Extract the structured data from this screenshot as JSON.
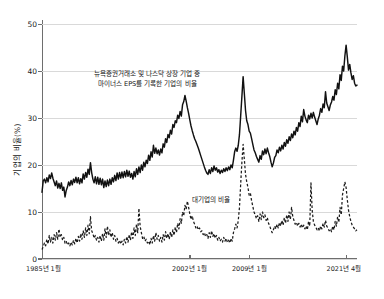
{
  "chart_data": {
    "type": "line",
    "title": "",
    "subtitle": "",
    "xlabel": "",
    "ylabel": "기업의 비율(%)",
    "ylim": [
      0,
      50
    ],
    "yticks": [
      0,
      10,
      20,
      30,
      40,
      50
    ],
    "ytick_labels": [
      "0",
      "10",
      "20",
      "30",
      "40",
      "50"
    ],
    "grid": true,
    "legend_position": "inline-annotation",
    "xtick_labels": [
      "1985년 1월",
      "2002년 1월",
      "2009년 1월",
      "2021년 4월"
    ],
    "xtick_positions": [
      0,
      0.468,
      0.658,
      0.965
    ],
    "annotations": [
      {
        "name": "series-solid-annotation",
        "line1": "뉴욕증권거래소 및 나스닥 상장 기업 중",
        "line2": "마이너스 EPS를 기록한 기업의 비율"
      },
      {
        "name": "series-dashed-annotation",
        "line1": "대기업의 비율"
      }
    ],
    "series": [
      {
        "name": "뉴욕증권거래소 및 나스닥 상장 기업 중 마이너스 EPS를 기록한 기업의 비율",
        "style": "solid",
        "color": "#111111",
        "values": [
          14.2,
          16.6,
          17.0,
          16.2,
          17.3,
          16.4,
          17.9,
          17.1,
          18.3,
          17.2,
          16.4,
          15.6,
          16.6,
          15.1,
          16.1,
          15.0,
          16.2,
          14.6,
          15.3,
          13.2,
          14.6,
          15.3,
          16.4,
          15.6,
          16.7,
          15.8,
          17.0,
          16.3,
          17.4,
          16.2,
          17.3,
          16.0,
          17.1,
          16.2,
          18.1,
          17.0,
          18.4,
          17.4,
          19.1,
          18.0,
          20.5,
          18.4,
          17.0,
          16.2,
          17.5,
          16.0,
          17.4,
          15.9,
          17.2,
          15.8,
          17.0,
          15.2,
          16.6,
          15.4,
          16.8,
          15.6,
          17.0,
          15.9,
          17.3,
          16.4,
          17.8,
          16.7,
          18.3,
          17.0,
          18.4,
          17.2,
          18.5,
          17.3,
          18.6,
          17.5,
          18.9,
          17.6,
          18.7,
          17.4,
          18.2,
          17.0,
          18.6,
          17.5,
          19.2,
          18.0,
          19.6,
          18.4,
          20.0,
          18.9,
          20.6,
          19.6,
          21.0,
          20.3,
          22.1,
          21.0,
          22.8,
          21.7,
          24.2,
          22.5,
          23.6,
          22.4,
          23.2,
          22.1,
          23.4,
          22.6,
          24.5,
          23.8,
          25.6,
          24.8,
          26.5,
          25.8,
          27.4,
          26.6,
          28.6,
          28.0,
          29.4,
          29.0,
          30.6,
          29.9,
          31.4,
          30.4,
          32.8,
          33.5,
          34.8,
          33.6,
          32.2,
          31.0,
          29.6,
          28.3,
          27.3,
          26.4,
          25.6,
          25.0,
          24.3,
          23.6,
          22.8,
          22.0,
          21.2,
          20.4,
          19.6,
          18.9,
          18.3,
          18.0,
          19.0,
          18.2,
          19.4,
          18.6,
          19.8,
          18.9,
          19.4,
          18.5,
          19.0,
          18.2,
          18.9,
          18.4,
          19.2,
          18.6,
          19.4,
          18.8,
          19.6,
          19.0,
          20.0,
          19.4,
          21.0,
          22.8,
          23.6,
          22.9,
          24.2,
          26.5,
          30.5,
          34.6,
          38.8,
          35.2,
          31.6,
          29.4,
          28.6,
          27.2,
          26.8,
          25.6,
          24.4,
          23.2,
          22.6,
          21.8,
          21.2,
          20.6,
          22.0,
          21.2,
          23.0,
          22.2,
          23.4,
          22.4,
          23.6,
          22.6,
          21.8,
          20.6,
          19.6,
          20.4,
          21.6,
          22.0,
          23.2,
          22.6,
          23.8,
          23.0,
          24.2,
          23.4,
          24.8,
          24.0,
          25.4,
          24.6,
          26.0,
          25.2,
          26.6,
          25.8,
          27.2,
          26.4,
          28.0,
          27.2,
          29.0,
          28.2,
          30.4,
          29.2,
          31.8,
          30.4,
          29.6,
          29.0,
          30.6,
          29.8,
          31.0,
          30.0,
          31.2,
          30.2,
          29.4,
          28.6,
          29.8,
          30.6,
          32.0,
          31.2,
          33.0,
          32.2,
          35.6,
          33.2,
          32.4,
          31.6,
          32.8,
          33.4,
          34.6,
          33.8,
          36.0,
          35.0,
          37.4,
          36.2,
          39.2,
          38.0,
          41.0,
          40.0,
          43.2,
          45.5,
          43.0,
          40.2,
          41.4,
          39.6,
          38.2,
          39.0,
          37.4,
          36.8,
          37.0
        ]
      },
      {
        "name": "대기업의 비율",
        "style": "dashed",
        "color": "#1c1c1c",
        "values": [
          2.0,
          2.6,
          3.4,
          2.8,
          4.2,
          3.2,
          5.0,
          3.6,
          4.6,
          3.4,
          5.2,
          4.0,
          5.6,
          4.2,
          6.4,
          4.6,
          5.2,
          4.0,
          4.6,
          3.4,
          3.8,
          3.0,
          3.4,
          2.8,
          3.6,
          3.0,
          4.0,
          3.2,
          4.4,
          3.4,
          4.8,
          3.8,
          5.4,
          4.2,
          6.0,
          4.6,
          6.6,
          5.0,
          7.2,
          5.4,
          9.0,
          6.0,
          5.4,
          4.4,
          5.0,
          4.0,
          4.6,
          3.6,
          5.0,
          3.8,
          5.4,
          4.0,
          6.4,
          4.6,
          7.0,
          5.0,
          6.2,
          4.6,
          5.6,
          4.2,
          5.0,
          3.8,
          4.4,
          3.4,
          4.0,
          3.2,
          3.8,
          3.0,
          4.2,
          3.4,
          4.8,
          3.6,
          5.2,
          4.0,
          5.8,
          4.4,
          6.6,
          5.0,
          7.4,
          5.6,
          10.8,
          7.0,
          5.6,
          4.4,
          4.8,
          3.8,
          4.2,
          3.4,
          3.8,
          3.0,
          4.4,
          3.4,
          5.0,
          3.8,
          5.6,
          4.2,
          5.0,
          3.8,
          4.6,
          3.6,
          5.2,
          4.0,
          5.8,
          4.4,
          5.4,
          4.2,
          5.8,
          4.6,
          6.2,
          5.0,
          6.8,
          5.6,
          7.6,
          6.4,
          8.6,
          7.6,
          10.0,
          9.2,
          11.4,
          10.6,
          12.3,
          11.0,
          9.6,
          8.4,
          9.2,
          8.0,
          7.4,
          6.6,
          7.0,
          6.2,
          6.6,
          5.8,
          6.0,
          5.2,
          5.6,
          4.8,
          5.2,
          4.4,
          5.6,
          4.6,
          6.0,
          4.8,
          5.4,
          4.4,
          5.0,
          4.0,
          4.6,
          3.8,
          4.2,
          3.6,
          4.6,
          3.8,
          4.4,
          3.6,
          4.0,
          3.4,
          4.4,
          3.8,
          5.6,
          6.4,
          7.4,
          6.6,
          8.2,
          11.0,
          16.0,
          20.6,
          24.4,
          21.2,
          18.0,
          16.4,
          15.2,
          13.6,
          14.0,
          12.4,
          11.2,
          10.0,
          9.4,
          8.6,
          9.2,
          8.0,
          9.6,
          8.4,
          10.0,
          8.8,
          9.4,
          8.2,
          8.8,
          7.6,
          7.0,
          6.2,
          5.6,
          6.2,
          7.0,
          6.4,
          7.4,
          6.6,
          7.8,
          7.0,
          8.2,
          7.2,
          8.8,
          7.6,
          9.4,
          8.0,
          10.0,
          8.4,
          11.0,
          9.0,
          8.2,
          7.4,
          7.8,
          7.0,
          7.6,
          6.8,
          7.4,
          6.6,
          7.2,
          6.4,
          7.0,
          6.2,
          8.0,
          7.0,
          16.2,
          10.4,
          8.0,
          7.2,
          6.8,
          6.2,
          6.6,
          6.0,
          7.0,
          6.4,
          7.6,
          6.8,
          8.2,
          7.0,
          6.6,
          6.0,
          6.4,
          5.8,
          7.0,
          6.2,
          8.0,
          7.0,
          9.0,
          7.8,
          11.0,
          9.4,
          13.6,
          15.0,
          16.4,
          15.2,
          12.6,
          10.4,
          9.0,
          8.0,
          7.2,
          6.8,
          6.4,
          6.0,
          6.2
        ]
      }
    ]
  }
}
